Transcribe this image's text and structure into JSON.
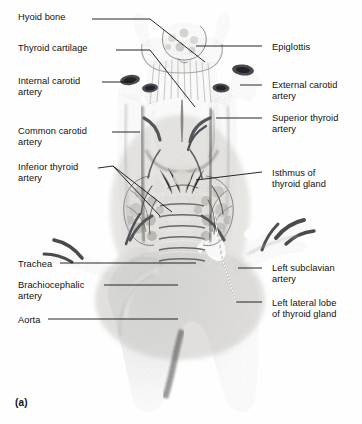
{
  "figure": {
    "panel_letter": "(a)",
    "background_color": "#fefefe",
    "ink_color": "#111111"
  },
  "labels_left": [
    {
      "id": "hyoid-bone",
      "text": "Hyoid bone",
      "x": 18,
      "y": 12
    },
    {
      "id": "thyroid-cartilage",
      "text": "Thyroid cartilage",
      "x": 18,
      "y": 43
    },
    {
      "id": "internal-carotid",
      "text": "Internal carotid\nartery",
      "x": 18,
      "y": 76
    },
    {
      "id": "common-carotid",
      "text": "Common carotid\nartery",
      "x": 18,
      "y": 126
    },
    {
      "id": "inferior-thyroid",
      "text": "Inferior thyroid\nartery",
      "x": 18,
      "y": 162
    },
    {
      "id": "trachea",
      "text": "Trachea",
      "x": 18,
      "y": 259
    },
    {
      "id": "brachiocephalic",
      "text": "Brachiocephalic\nartery",
      "x": 18,
      "y": 280
    },
    {
      "id": "aorta",
      "text": "Aorta",
      "x": 18,
      "y": 315
    }
  ],
  "labels_right": [
    {
      "id": "epiglottis",
      "text": "Epiglottis",
      "x": 272,
      "y": 42
    },
    {
      "id": "external-carotid",
      "text": "External carotid\nartery",
      "x": 272,
      "y": 80
    },
    {
      "id": "superior-thyroid",
      "text": "Superior thyroid\nartery",
      "x": 272,
      "y": 113
    },
    {
      "id": "isthmus",
      "text": "Isthmus of\nthyroid gland",
      "x": 272,
      "y": 168
    },
    {
      "id": "left-subclavian",
      "text": "Left subclavian\nartery",
      "x": 272,
      "y": 263
    },
    {
      "id": "left-lateral-lobe",
      "text": "Left lateral lobe\nof thyroid gland",
      "x": 272,
      "y": 298
    }
  ],
  "leaders": [
    {
      "id": "leader-hyoid-bone",
      "d": "M 92,19 L 150,19 L 205,62"
    },
    {
      "id": "leader-thyroid-cartilage",
      "d": "M 116,50 L 150,50 L 195,107"
    },
    {
      "id": "leader-internal-carotid",
      "d": "M 102,82 L 133,82"
    },
    {
      "id": "leader-common-carotid",
      "d": "M 112,132 L 140,132"
    },
    {
      "id": "leader-inf-thyroid-a",
      "d": "M 98,168 L 113,166 L 172,212"
    },
    {
      "id": "leader-inf-thyroid-b",
      "d": "M 113,166 L 160,216"
    },
    {
      "id": "leader-trachea",
      "d": "M 60,263 L 196,263"
    },
    {
      "id": "leader-brachiocephalic",
      "d": "M 104,285 L 178,285"
    },
    {
      "id": "leader-aorta",
      "d": "M 48,319 L 178,319"
    },
    {
      "id": "leader-epiglottis",
      "d": "M 262,46 L 196,46"
    },
    {
      "id": "leader-external-carotid",
      "d": "M 262,85 L 240,85"
    },
    {
      "id": "leader-superior-thyroid",
      "d": "M 262,118 L 216,118"
    },
    {
      "id": "leader-isthmus",
      "d": "M 262,172 L 196,180"
    },
    {
      "id": "leader-left-subclavian",
      "d": "M 262,268 L 238,268"
    },
    {
      "id": "leader-left-lateral-lobe",
      "d": "M 262,302 L 236,302"
    },
    {
      "id": "leader-left-lobe-stalk",
      "d": "M 236,302 L 222,258 L 214,212"
    }
  ],
  "anatomy_notes": {
    "epiglottis": "leaf-shaped mottled cartilage at superior midline",
    "hyoid": "U-shaped bone arching below epiglottis",
    "thyroid_cartilage": "shield-shaped laryngeal prominence with midline notch",
    "cricothyroid": "striated membrane below thyroid cartilage",
    "thyroid_lobes": "paired pear-shaped glandular lobes flanking trachea",
    "isthmus": "narrow band crossing trachea between lobes",
    "trachea": "segmented cartilaginous rings descending midline",
    "aortic_arch": "broad dark arch at inferior field giving rise to branches",
    "vessels": "cut-ended carotid trunks bilaterally with open lumens"
  }
}
